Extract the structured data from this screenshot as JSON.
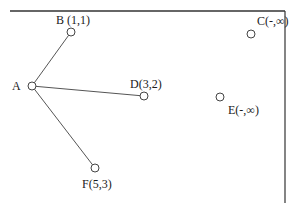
{
  "diagram": {
    "type": "graph",
    "frame": {
      "top_border": {
        "x1": 10,
        "y1": 11,
        "x2": 285,
        "y2": 11
      },
      "right_border": {
        "x1": 285,
        "y1": 11,
        "x2": 285,
        "y2": 203
      },
      "color": "#333333"
    },
    "node_style": {
      "radius": 4,
      "stroke": "#444444",
      "fill": "#ffffff"
    },
    "edge_style": {
      "stroke": "#555555"
    },
    "nodes": [
      {
        "id": "A",
        "label": "A",
        "x": 32,
        "y": 86,
        "label_x": 12,
        "label_y": 80
      },
      {
        "id": "B",
        "label": "B (1,1)",
        "x": 71,
        "y": 32,
        "label_x": 56,
        "label_y": 14
      },
      {
        "id": "C",
        "label": "C(-,∞)",
        "x": 251,
        "y": 34,
        "label_x": 257,
        "label_y": 15
      },
      {
        "id": "D",
        "label": "D(3,2)",
        "x": 144,
        "y": 96,
        "label_x": 130,
        "label_y": 78
      },
      {
        "id": "E",
        "label": "E(-,∞)",
        "x": 220,
        "y": 97,
        "label_x": 228,
        "label_y": 104
      },
      {
        "id": "F",
        "label": "F(5,3)",
        "x": 95,
        "y": 168,
        "label_x": 82,
        "label_y": 178
      }
    ],
    "edges": [
      {
        "from": "A",
        "to": "B"
      },
      {
        "from": "A",
        "to": "D"
      },
      {
        "from": "A",
        "to": "F"
      }
    ]
  }
}
